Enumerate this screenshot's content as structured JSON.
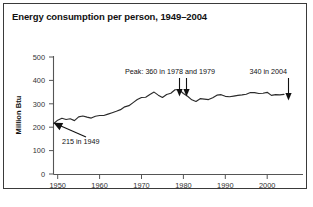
{
  "chart_data": {
    "type": "line",
    "title": "Energy consumption per person, 1949–2004",
    "xlabel": "",
    "ylabel": "Million Btu",
    "xlim": [
      1949,
      2004
    ],
    "ylim": [
      0,
      500
    ],
    "grid": false,
    "legend": "none",
    "x_ticks": [
      "1950",
      "1960",
      "1970",
      "1980",
      "1990",
      "2000"
    ],
    "x_tick_values": [
      1950,
      1960,
      1970,
      1980,
      1990,
      2000
    ],
    "y_ticks": [
      "0",
      "100",
      "200",
      "300",
      "400",
      "500"
    ],
    "y_tick_values": [
      0,
      100,
      200,
      300,
      400,
      500
    ],
    "series": [
      {
        "name": "Energy consumption per person",
        "units": "Million Btu",
        "x": [
          1949,
          1950,
          1951,
          1952,
          1953,
          1954,
          1955,
          1956,
          1957,
          1958,
          1959,
          1960,
          1961,
          1962,
          1963,
          1964,
          1965,
          1966,
          1967,
          1968,
          1969,
          1970,
          1971,
          1972,
          1973,
          1974,
          1975,
          1976,
          1977,
          1978,
          1979,
          1980,
          1981,
          1982,
          1983,
          1984,
          1985,
          1986,
          1987,
          1988,
          1989,
          1990,
          1991,
          1992,
          1993,
          1994,
          1995,
          1996,
          1997,
          1998,
          1999,
          2000,
          2001,
          2002,
          2003,
          2004
        ],
        "values": [
          215,
          230,
          238,
          233,
          236,
          228,
          244,
          248,
          243,
          239,
          247,
          250,
          250,
          256,
          262,
          268,
          275,
          287,
          292,
          305,
          318,
          327,
          328,
          340,
          350,
          337,
          327,
          340,
          345,
          360,
          360,
          344,
          332,
          317,
          310,
          322,
          320,
          318,
          326,
          337,
          339,
          332,
          330,
          333,
          336,
          338,
          341,
          348,
          348,
          344,
          345,
          349,
          336,
          339,
          338,
          340
        ]
      }
    ],
    "annotations": [
      {
        "name": "start-value",
        "text": "215 in 1949",
        "point_year": 1949,
        "point_value": 215
      },
      {
        "name": "peak-value",
        "text": "Peak: 360 in 1978 and 1979",
        "point_years": [
          1978,
          1979
        ],
        "point_value": 360
      },
      {
        "name": "end-value",
        "text": "340 in 2004",
        "point_year": 2004,
        "point_value": 340
      }
    ],
    "colors": {
      "line": "#2b2b2b",
      "axis": "#555555",
      "text": "#111111",
      "background": "#ffffff",
      "border": "#3a3a3a"
    }
  }
}
